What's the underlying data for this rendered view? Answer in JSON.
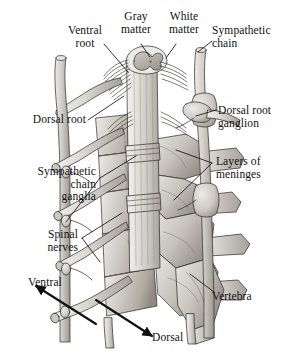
{
  "figure": {
    "background_color": "#ffffff",
    "ink_color": "#111111",
    "width": 287,
    "height": 354
  },
  "labels": {
    "ventral_root": "Ventral\nroot",
    "gray_matter": "Gray\nmatter",
    "white_matter": "White\nmatter",
    "sympathetic_chain": "Sympathetic\nchain",
    "dorsal_root": "Dorsal root",
    "dorsal_root_ganglion": "Dorsal root\nganglion",
    "layers_of_meninges": "Layers of\nmeninges",
    "sympathetic_chain_ganglia": "Sympathetic\nchain\nganglia",
    "spinal_nerves": "Spinal\nnerves",
    "ventral": "Ventral",
    "dorsal": "Dorsal",
    "vertebra": "Vertebra"
  },
  "structures": [
    {
      "name": "spinal-cord",
      "description": "Central vertical spinal cord column with cut cross-section at top"
    },
    {
      "name": "gray-matter",
      "description": "Butterfly-shaped inner gray matter at cut surface"
    },
    {
      "name": "white-matter",
      "description": "Outer pale ring of white matter at cut surface"
    },
    {
      "name": "meninges",
      "description": "Layered membrane sheaths surrounding the cord"
    },
    {
      "name": "ventral-root",
      "description": "Anterior motor rootlets leaving the cord"
    },
    {
      "name": "dorsal-root",
      "description": "Posterior sensory rootlets entering the cord"
    },
    {
      "name": "dorsal-root-ganglion",
      "description": "Swollen ganglion on the dorsal root"
    },
    {
      "name": "sympathetic-chain",
      "description": "Paravertebral chain running parallel to the cord"
    },
    {
      "name": "sympathetic-chain-ganglia",
      "description": "Bead-like ganglia along the sympathetic chain"
    },
    {
      "name": "spinal-nerves",
      "description": "Mixed nerves exiting laterally between vertebrae"
    },
    {
      "name": "vertebra",
      "description": "Stacked vertebral bodies and processes"
    }
  ],
  "orientation_arrows": [
    {
      "name": "ventral-arrow",
      "label": "Ventral",
      "direction": "upper-left"
    },
    {
      "name": "dorsal-arrow",
      "label": "Dorsal",
      "direction": "lower-right"
    }
  ],
  "palette": {
    "line": "#1a1a1a",
    "bone_light": "#dedbd6",
    "bone_mid": "#c3bfb9",
    "bone_dark": "#9d9890",
    "cord_light": "#e4e2de",
    "cord_mid": "#cbc8c3",
    "nerve": "#d6d3ce",
    "shadow": "#8c877f"
  }
}
